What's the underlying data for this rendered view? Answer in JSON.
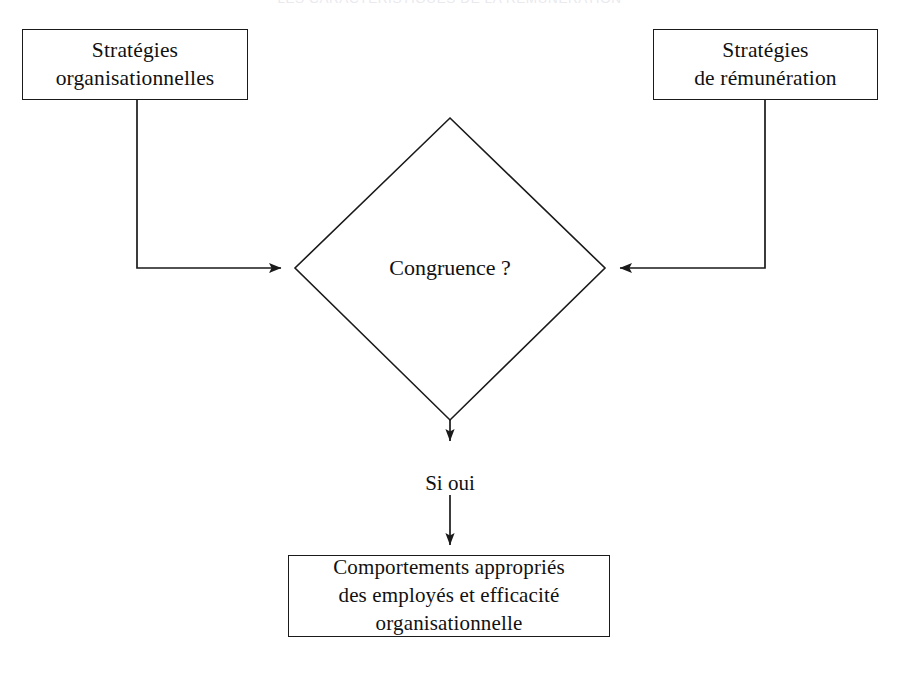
{
  "page": {
    "title": "LES CARACTÉRISTIQUES DE LA RÉMUNÉRATION",
    "background_color": "#ffffff",
    "line_color": "#1a1a1a",
    "text_color": "#111111"
  },
  "diagram": {
    "type": "flowchart",
    "nodes": {
      "strategies_organisationnelles": {
        "shape": "rectangle",
        "label": "Stratégies\norganisationnelles"
      },
      "strategies_remuneration": {
        "shape": "rectangle",
        "label": "Stratégies\nde rémunération"
      },
      "congruence": {
        "shape": "diamond",
        "label": "Congruence ?"
      },
      "resultat": {
        "shape": "rectangle",
        "label": "Comportements appropriés\ndes employés et efficacité\norganisationnelle"
      }
    },
    "edges": [
      {
        "from": "strategies_organisationnelles",
        "to": "congruence",
        "label": "",
        "style": "elbow-right-arrow"
      },
      {
        "from": "strategies_remuneration",
        "to": "congruence",
        "label": "",
        "style": "elbow-left-arrow"
      },
      {
        "from": "congruence",
        "to": "resultat",
        "label": "Si oui",
        "style": "vertical-arrow"
      }
    ]
  }
}
